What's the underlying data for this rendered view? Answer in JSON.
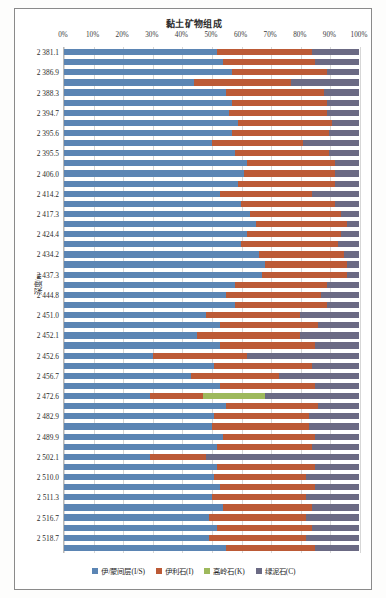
{
  "chart_data": {
    "type": "bar",
    "subtype": "stacked-horizontal-100-percent",
    "title": "黏土矿物组成",
    "xlabel": "",
    "ylabel": "深度/m",
    "xlim": [
      0,
      100
    ],
    "grid": true,
    "legend_position": "bottom",
    "xtick_labels": [
      "0%",
      "10%",
      "20%",
      "30%",
      "40%",
      "50%",
      "60%",
      "70%",
      "80%",
      "90%",
      "100%"
    ],
    "xtick_values": [
      0,
      10,
      20,
      30,
      40,
      50,
      60,
      70,
      80,
      90,
      100
    ],
    "categories": [
      "2 381.1",
      "",
      "2 386.9",
      "",
      "2 388.3",
      "",
      "2 394.7",
      "",
      "2 395.6",
      "",
      "2 395.5",
      "",
      "2 406.0",
      "",
      "2 414.2",
      "",
      "2 417.3",
      "",
      "2 424.4",
      "",
      "2 434.2",
      "",
      "2 437.3",
      "",
      "2 444.8",
      "",
      "2 451.0",
      "",
      "2 452.1",
      "",
      "2 452.6",
      "",
      "2 456.7",
      "",
      "2 472.6",
      "",
      "2 482.9",
      "",
      "2 489.9",
      "",
      "2 502.1",
      "",
      "2 510.0",
      "",
      "2 511.3",
      "",
      "2 516.7",
      "",
      "2 518.7",
      ""
    ],
    "visible_depth_labels": [
      "2 381.1",
      "2 386.9",
      "2 388.3",
      "2 394.7",
      "2 395.6",
      "2 395.5",
      "2 406.0",
      "2 414.2",
      "2 417.3",
      "2 424.4",
      "2 434.2",
      "2 437.3",
      "2 444.8",
      "2 451.0",
      "2 452.1",
      "2 452.6",
      "2 456.7",
      "2 472.6",
      "2 482.9",
      "2 489.9",
      "2 502.1",
      "2 510.0",
      "2 511.3",
      "2 516.7",
      "2 518.7"
    ],
    "series": [
      {
        "name": "伊/蒙间层(I/S)",
        "color": "#5b85b4",
        "values": [
          52,
          54,
          57,
          44,
          55,
          57,
          56,
          59,
          57,
          50,
          58,
          62,
          61,
          59,
          53,
          60,
          63,
          65,
          62,
          60,
          66,
          68,
          67,
          58,
          55,
          58,
          48,
          53,
          45,
          53,
          30,
          51,
          43,
          53,
          29,
          55,
          51,
          50,
          54,
          52,
          29,
          52,
          51,
          53,
          50,
          54,
          49,
          52,
          49,
          55
        ]
      },
      {
        "name": "伊利石(I)",
        "color": "#bc5a36",
        "values": [
          32,
          31,
          32,
          33,
          33,
          32,
          33,
          32,
          33,
          31,
          32,
          30,
          31,
          33,
          31,
          32,
          31,
          31,
          32,
          33,
          29,
          28,
          29,
          31,
          32,
          31,
          32,
          33,
          35,
          32,
          32,
          33,
          30,
          32,
          18,
          31,
          32,
          33,
          31,
          32,
          19,
          33,
          31,
          32,
          32,
          30,
          33,
          32,
          33,
          30
        ]
      },
      {
        "name": "高岭石(K)",
        "color": "#9eb95c",
        "values": [
          0,
          0,
          0,
          0,
          0,
          0,
          0,
          0,
          0,
          0,
          0,
          0,
          0,
          0,
          0,
          0,
          0,
          0,
          0,
          0,
          0,
          0,
          0,
          0,
          0,
          0,
          0,
          0,
          0,
          0,
          0,
          0,
          0,
          0,
          21,
          0,
          0,
          0,
          0,
          0,
          0,
          0,
          0,
          0,
          0,
          0,
          0,
          0,
          0,
          0
        ]
      },
      {
        "name": "绿泥石(C)",
        "color": "#6b6a84",
        "values": [
          16,
          15,
          11,
          23,
          12,
          11,
          11,
          9,
          10,
          19,
          10,
          8,
          8,
          8,
          16,
          8,
          6,
          4,
          6,
          7,
          5,
          4,
          4,
          11,
          13,
          11,
          20,
          14,
          20,
          15,
          38,
          16,
          27,
          15,
          32,
          14,
          17,
          17,
          15,
          16,
          52,
          15,
          18,
          15,
          18,
          16,
          18,
          16,
          18,
          15
        ]
      }
    ]
  },
  "legend": {
    "items": [
      {
        "label": "伊/蒙间层(I/S)",
        "color": "#5b85b4"
      },
      {
        "label": "伊利石(I)",
        "color": "#bc5a36"
      },
      {
        "label": "高岭石(K)",
        "color": "#9eb95c"
      },
      {
        "label": "绿泥石(C)",
        "color": "#6b6a84"
      }
    ]
  }
}
